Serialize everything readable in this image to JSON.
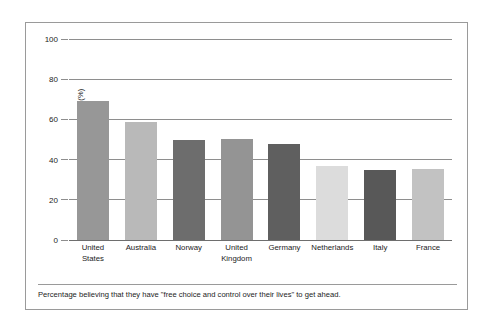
{
  "figure": {
    "caption": "Percentage believing that they have \"free choice and control over their lives\" to get ahead."
  },
  "axis": {
    "y_title": "Percentage (%)",
    "tick_labels": [
      "0",
      "20",
      "40",
      "60",
      "80",
      "100"
    ]
  },
  "chart_data": {
    "type": "bar",
    "title": "",
    "xlabel": "",
    "ylabel": "Percentage (%)",
    "ylim": [
      0,
      100
    ],
    "yticks": [
      0,
      20,
      40,
      60,
      80,
      100
    ],
    "grid": true,
    "legend": "none",
    "categories": [
      "United States",
      "Australia",
      "Norway",
      "United Kingdom",
      "Germany",
      "Netherlands",
      "Italy",
      "France"
    ],
    "category_lines": [
      [
        "United",
        "States"
      ],
      [
        "Australia"
      ],
      [
        "Norway"
      ],
      [
        "United",
        "Kingdom"
      ],
      [
        "Germany"
      ],
      [
        "Netherlands"
      ],
      [
        "Italy"
      ],
      [
        "France"
      ]
    ],
    "values": [
      69,
      58.5,
      50,
      50.5,
      48,
      37,
      35,
      35.5
    ],
    "bar_colors": [
      "#979797",
      "#b9b9b9",
      "#6d6d6d",
      "#949494",
      "#5f5f5f",
      "#dcdcdc",
      "#585858",
      "#c2c2c2"
    ]
  }
}
